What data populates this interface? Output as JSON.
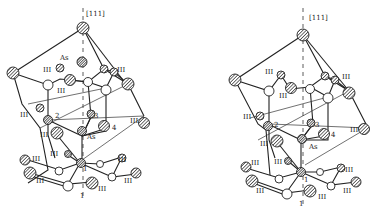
{
  "figure": {
    "type": "stereo pair crystal structure",
    "axis_label": "[111]",
    "left": {
      "labels": [
        {
          "text": "[111]",
          "x": 86,
          "y": 16
        },
        {
          "text": "As",
          "sub": "Ga",
          "x": 60,
          "y": 60,
          "note": "Asₐ (interstitial)"
        },
        {
          "text": "III",
          "sup": "5",
          "x": 43,
          "y": 70
        },
        {
          "text": "III",
          "sup": "a",
          "x": 117,
          "y": 70
        },
        {
          "text": "III",
          "sub": "6",
          "x": 57,
          "y": 92
        },
        {
          "text": "III",
          "sub": "3",
          "x": 20,
          "y": 116
        },
        {
          "text": "2",
          "x": 55,
          "y": 117
        },
        {
          "text": "3",
          "x": 94,
          "y": 117
        },
        {
          "text": "4",
          "x": 112,
          "y": 129
        },
        {
          "text": "III",
          "sub": "b",
          "x": 130,
          "y": 122
        },
        {
          "text": "III",
          "sub": "6",
          "x": 40,
          "y": 136
        },
        {
          "text": "As",
          "sub": "Ga",
          "x": 87,
          "y": 137
        },
        {
          "text": "III",
          "sub": "2",
          "x": 55,
          "y": 154
        },
        {
          "text": "III",
          "sub": "4",
          "x": 32,
          "y": 160
        },
        {
          "text": "1",
          "x": 83,
          "y": 168
        },
        {
          "text": "III",
          "sub": "4",
          "x": 118,
          "y": 161
        },
        {
          "text": "III",
          "sub": "1",
          "x": 36,
          "y": 182
        },
        {
          "text": "III",
          "sub": "c",
          "x": 126,
          "y": 176
        },
        {
          "text": "III",
          "sub": "c",
          "x": 97,
          "y": 190
        },
        {
          "text": "1",
          "x": 80,
          "y": 197
        }
      ]
    },
    "right": {
      "labels": [
        {
          "text": "[111]",
          "x": 309,
          "y": 16
        },
        {
          "text": "III",
          "x": 267,
          "y": 72
        },
        {
          "text": "III",
          "x": 343,
          "y": 79
        },
        {
          "text": "III",
          "x": 279,
          "y": 95
        },
        {
          "text": "III",
          "x": 246,
          "y": 118
        },
        {
          "text": "2",
          "x": 277,
          "y": 127
        },
        {
          "text": "3",
          "x": 316,
          "y": 127
        },
        {
          "text": "4",
          "x": 332,
          "y": 136
        },
        {
          "text": "III",
          "x": 352,
          "y": 131
        },
        {
          "text": "III",
          "x": 262,
          "y": 145
        },
        {
          "text": "As",
          "sub": "Ga",
          "x": 310,
          "y": 149
        },
        {
          "text": "III",
          "x": 276,
          "y": 163
        },
        {
          "text": "III",
          "x": 245,
          "y": 167
        },
        {
          "text": "1",
          "x": 304,
          "y": 182
        },
        {
          "text": "III",
          "x": 342,
          "y": 170
        },
        {
          "text": "III",
          "x": 253,
          "y": 190
        },
        {
          "text": "III",
          "x": 341,
          "y": 190
        },
        {
          "text": "III",
          "x": 318,
          "y": 200
        },
        {
          "text": "1",
          "x": 299,
          "y": 205
        }
      ]
    }
  }
}
